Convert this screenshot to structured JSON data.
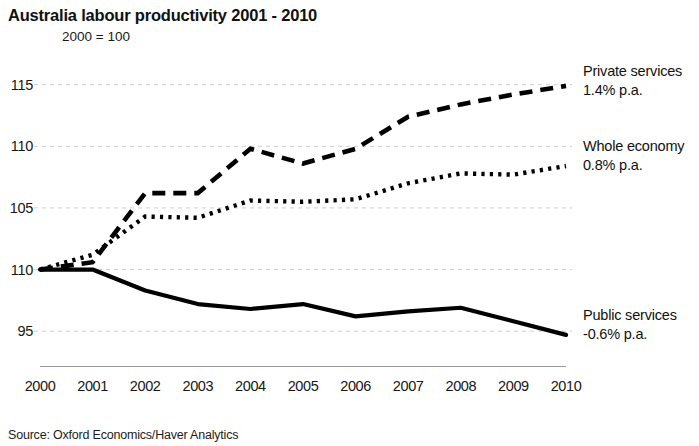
{
  "chart_data": {
    "type": "line",
    "title": "Australia labour productivity 2001 - 2010",
    "subtitle": "2000 = 100",
    "xlabel": "",
    "ylabel": "",
    "grid": true,
    "legend_position": "right-inline-annotations",
    "x": [
      2000,
      2001,
      2002,
      2003,
      2004,
      2005,
      2006,
      2007,
      2008,
      2009,
      2010
    ],
    "categories": [
      "2000",
      "2001",
      "2002",
      "2003",
      "2004",
      "2005",
      "2006",
      "2007",
      "2008",
      "2009",
      "2010"
    ],
    "xlim": [
      2000,
      2010
    ],
    "ylim": [
      92.5,
      117
    ],
    "yticks": [
      115,
      110,
      105,
      110,
      95
    ],
    "ytick_values": [
      115,
      110,
      105,
      100,
      95
    ],
    "series": [
      {
        "name": "Private services",
        "rate_label": "1.4% p.a.",
        "style": "dashed",
        "color": "#000000",
        "values": [
          100.0,
          100.6,
          106.2,
          106.2,
          109.8,
          108.6,
          109.8,
          112.4,
          113.4,
          114.2,
          114.9
        ]
      },
      {
        "name": "Whole economy",
        "rate_label": "0.8% p.a.",
        "style": "dotted",
        "color": "#000000",
        "values": [
          100.0,
          101.2,
          104.3,
          104.2,
          105.6,
          105.5,
          105.7,
          107.0,
          107.8,
          107.7,
          108.4
        ]
      },
      {
        "name": "Public services",
        "rate_label": "-0.6% p.a.",
        "style": "solid",
        "color": "#000000",
        "values": [
          100.0,
          100.0,
          98.3,
          97.2,
          96.8,
          97.2,
          96.2,
          96.6,
          96.9,
          95.8,
          94.7
        ]
      }
    ],
    "source": "Source: Oxford Economics/Haver Analytics"
  },
  "axis": {
    "yticks": [
      {
        "label": "115",
        "value": 115
      },
      {
        "label": "110",
        "value": 110
      },
      {
        "label": "105",
        "value": 105
      },
      {
        "label": "110",
        "value": 100
      },
      {
        "label": "95",
        "value": 95
      }
    ],
    "xticks": [
      {
        "label": "2000"
      },
      {
        "label": "2001"
      },
      {
        "label": "2002"
      },
      {
        "label": "2003"
      },
      {
        "label": "2004"
      },
      {
        "label": "2005"
      },
      {
        "label": "2006"
      },
      {
        "label": "2007"
      },
      {
        "label": "2008"
      },
      {
        "label": "2009"
      },
      {
        "label": "2010"
      }
    ]
  },
  "annotations": {
    "private": {
      "name": "Private services",
      "rate": "1.4% p.a."
    },
    "whole": {
      "name": "Whole economy",
      "rate": "0.8% p.a."
    },
    "public": {
      "name": "Public services",
      "rate": "-0.6% p.a."
    }
  },
  "footer": {
    "source": "Source: Oxford Economics/Haver Analytics"
  },
  "colors": {
    "ink": "#000000",
    "gridline": "#cfcfcf",
    "axis": "#9a9a9a",
    "background": "#ffffff"
  }
}
